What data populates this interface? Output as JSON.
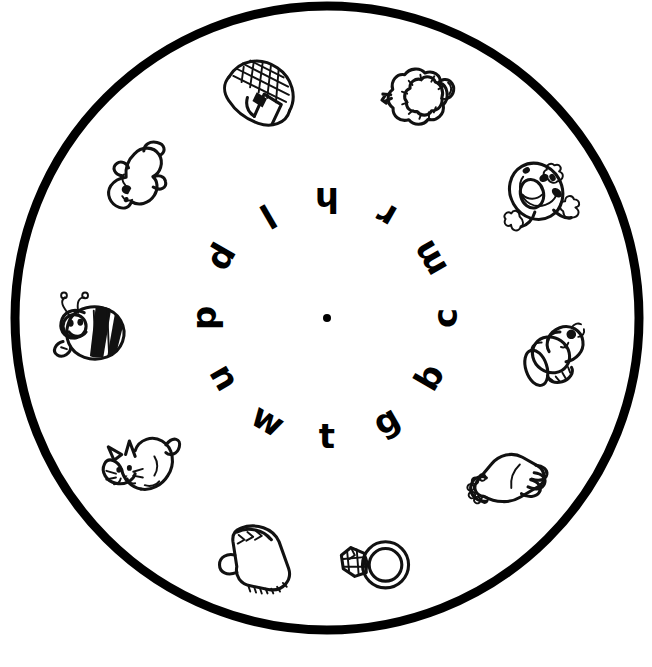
{
  "page": {
    "background_color": "#ffffff",
    "ink_color": "#111111",
    "width": 652,
    "height": 667
  },
  "wheel": {
    "center_x": 327,
    "center_y": 318,
    "outer_radius": 312,
    "rim_stroke_width": 9,
    "rim_color": "#000000",
    "center_dot_label": "center-pivot-dot",
    "letter_ring_radius": 118,
    "picture_ring_radius": 243
  },
  "letters": [
    {
      "char": "h",
      "angle_deg": 0,
      "rotation_deg": 180,
      "name": "letter-h"
    },
    {
      "char": "r",
      "angle_deg": 30,
      "rotation_deg": 210,
      "name": "letter-r"
    },
    {
      "char": "m",
      "angle_deg": 60,
      "rotation_deg": 240,
      "name": "letter-m"
    },
    {
      "char": "c",
      "angle_deg": 90,
      "rotation_deg": 270,
      "name": "letter-c"
    },
    {
      "char": "b",
      "angle_deg": 120,
      "rotation_deg": 300,
      "name": "letter-b"
    },
    {
      "char": "g",
      "angle_deg": 150,
      "rotation_deg": 330,
      "name": "letter-g"
    },
    {
      "char": "t",
      "angle_deg": 180,
      "rotation_deg": 0,
      "name": "letter-t"
    },
    {
      "char": "w",
      "angle_deg": 210,
      "rotation_deg": 30,
      "name": "letter-w"
    },
    {
      "char": "n",
      "angle_deg": 240,
      "rotation_deg": 60,
      "name": "letter-n"
    },
    {
      "char": "d",
      "angle_deg": 270,
      "rotation_deg": 90,
      "name": "letter-d"
    },
    {
      "char": "p",
      "angle_deg": 300,
      "rotation_deg": 120,
      "name": "letter-p"
    },
    {
      "char": "l",
      "angle_deg": 330,
      "rotation_deg": 150,
      "name": "letter-l"
    }
  ],
  "pictures": [
    {
      "icon": "net-bag-icon",
      "label": "net",
      "x": 260,
      "y": 95,
      "rotation_deg": 195,
      "name": "picture-net"
    },
    {
      "icon": "lamb-icon",
      "label": "lamb",
      "x": 422,
      "y": 95,
      "rotation_deg": 170,
      "name": "picture-lamb"
    },
    {
      "icon": "nest-egg-icon",
      "label": "nest",
      "x": 540,
      "y": 198,
      "rotation_deg": 150,
      "name": "picture-nest"
    },
    {
      "icon": "mouse-icon",
      "label": "mouse",
      "x": 556,
      "y": 352,
      "rotation_deg": 150,
      "name": "picture-mouse"
    },
    {
      "icon": "hand-icon",
      "label": "hand",
      "x": 509,
      "y": 483,
      "rotation_deg": 200,
      "name": "picture-hand"
    },
    {
      "icon": "ring-icon",
      "label": "ring",
      "x": 374,
      "y": 561,
      "rotation_deg": 0,
      "name": "picture-ring"
    },
    {
      "icon": "mitten-icon",
      "label": "mitten",
      "x": 256,
      "y": 557,
      "rotation_deg": 0,
      "name": "picture-mitten"
    },
    {
      "icon": "cat-icon",
      "label": "cat",
      "x": 139,
      "y": 466,
      "rotation_deg": 0,
      "name": "picture-cat"
    },
    {
      "icon": "bee-icon",
      "label": "bee",
      "x": 88,
      "y": 330,
      "rotation_deg": 0,
      "name": "picture-bee"
    },
    {
      "icon": "duck-icon",
      "label": "duck",
      "x": 134,
      "y": 178,
      "rotation_deg": 200,
      "name": "picture-duck"
    }
  ]
}
